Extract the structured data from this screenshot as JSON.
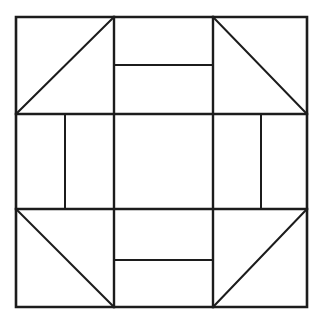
{
  "figure": {
    "type": "line-diagram",
    "background_color": "#ffffff",
    "line_color": "#1c1c1c",
    "canvas": {
      "width": 323,
      "height": 325
    }
  },
  "geometry": {
    "outer_square": {
      "left": 16,
      "top": 17,
      "right": 307,
      "bottom": 307
    },
    "grid": {
      "vertical_divisions": [
        114,
        213
      ],
      "horizontal_divisions": [
        114,
        209
      ]
    },
    "inner_dividers": {
      "top_center_horizontal": 65,
      "bottom_center_horizontal": 260,
      "middle_left_vertical": 65,
      "middle_right_vertical": 261
    }
  },
  "cells": [
    {
      "name": "top-left-corner",
      "row": 0,
      "col": 0,
      "content": "half-square-triangle",
      "diagonal": "bottom-left-to-top-right",
      "bounds": {
        "x1": 16,
        "y1": 17,
        "x2": 114,
        "y2": 114
      }
    },
    {
      "name": "top-center",
      "row": 0,
      "col": 1,
      "content": "two-stacked-rectangles",
      "divider": "horizontal",
      "bounds": {
        "x1": 114,
        "y1": 17,
        "x2": 213,
        "y2": 114
      }
    },
    {
      "name": "top-right-corner",
      "row": 0,
      "col": 2,
      "content": "half-square-triangle",
      "diagonal": "top-left-to-bottom-right",
      "bounds": {
        "x1": 213,
        "y1": 17,
        "x2": 307,
        "y2": 114
      }
    },
    {
      "name": "middle-left",
      "row": 1,
      "col": 0,
      "content": "two-side-by-side-rectangles",
      "divider": "vertical",
      "bounds": {
        "x1": 16,
        "y1": 114,
        "x2": 114,
        "y2": 209
      }
    },
    {
      "name": "center",
      "row": 1,
      "col": 1,
      "content": "plain-square",
      "divider": "none",
      "bounds": {
        "x1": 114,
        "y1": 114,
        "x2": 213,
        "y2": 209
      }
    },
    {
      "name": "middle-right",
      "row": 1,
      "col": 2,
      "content": "two-side-by-side-rectangles",
      "divider": "vertical",
      "bounds": {
        "x1": 213,
        "y1": 114,
        "x2": 307,
        "y2": 209
      }
    },
    {
      "name": "bottom-left-corner",
      "row": 2,
      "col": 0,
      "content": "half-square-triangle",
      "diagonal": "top-left-to-bottom-right",
      "bounds": {
        "x1": 16,
        "y1": 209,
        "x2": 114,
        "y2": 307
      }
    },
    {
      "name": "bottom-center",
      "row": 2,
      "col": 1,
      "content": "two-stacked-rectangles",
      "divider": "horizontal",
      "bounds": {
        "x1": 114,
        "y1": 209,
        "x2": 213,
        "y2": 307
      }
    },
    {
      "name": "bottom-right-corner",
      "row": 2,
      "col": 2,
      "content": "half-square-triangle",
      "diagonal": "bottom-left-to-top-right",
      "bounds": {
        "x1": 213,
        "y1": 209,
        "x2": 307,
        "y2": 307
      }
    }
  ],
  "paths": {
    "outer_frame": "M 16 17 L 307 17 L 307 307 L 16 307 Z",
    "grid_v1": "M 114 17 L 114 307",
    "grid_v2": "M 213 17 L 213 307",
    "grid_h1": "M 16 114 L 307 114",
    "grid_h2": "M 16 209 L 307 209",
    "top_center_divider": "M 114 65 L 213 65",
    "bottom_center_divider": "M 114 260 L 213 260",
    "middle_left_divider": "M 65 114 L 65 209",
    "middle_right_divider": "M 261 114 L 261 209",
    "diagonal_top_left": "M 16 114 L 114 17",
    "diagonal_top_right": "M 213 17 L 307 114",
    "diagonal_bottom_left": "M 16 209 L 114 307",
    "diagonal_bottom_right": "M 213 307 L 307 209"
  }
}
